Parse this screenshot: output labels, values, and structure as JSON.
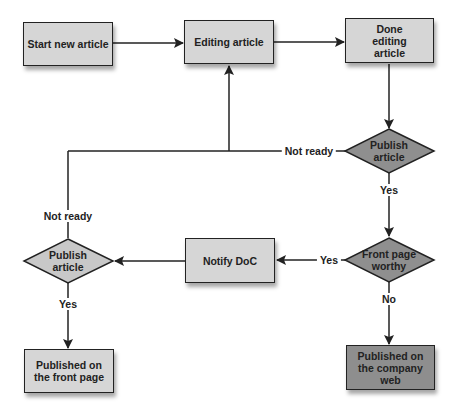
{
  "colors": {
    "box_fill": "#d6d6d6",
    "box_fill_dark": "#8e8e8e",
    "diamond_fill_right": "#8f8f8f",
    "diamond_fill_left": "#c8c8c8",
    "stroke": "#222222"
  },
  "nodes": {
    "start": {
      "label": "Start new article"
    },
    "editing": {
      "label": "Editing article"
    },
    "done_editing": {
      "label": "Done editing article"
    },
    "publish_check_right": {
      "label": "Publish article"
    },
    "front_page_worthy": {
      "label": "Front page worthy"
    },
    "notify_doc": {
      "label": "Notify DoC"
    },
    "publish_check_left": {
      "label": "Publish article"
    },
    "published_front": {
      "label": "Published on the front page"
    },
    "published_company": {
      "label": "Published on the company web"
    }
  },
  "edges": {
    "not_ready_right": "Not ready",
    "yes_publish_right": "Yes",
    "yes_front_page": "Yes",
    "no_front_page": "No",
    "not_ready_left": "Not ready",
    "yes_publish_left": "Yes"
  }
}
